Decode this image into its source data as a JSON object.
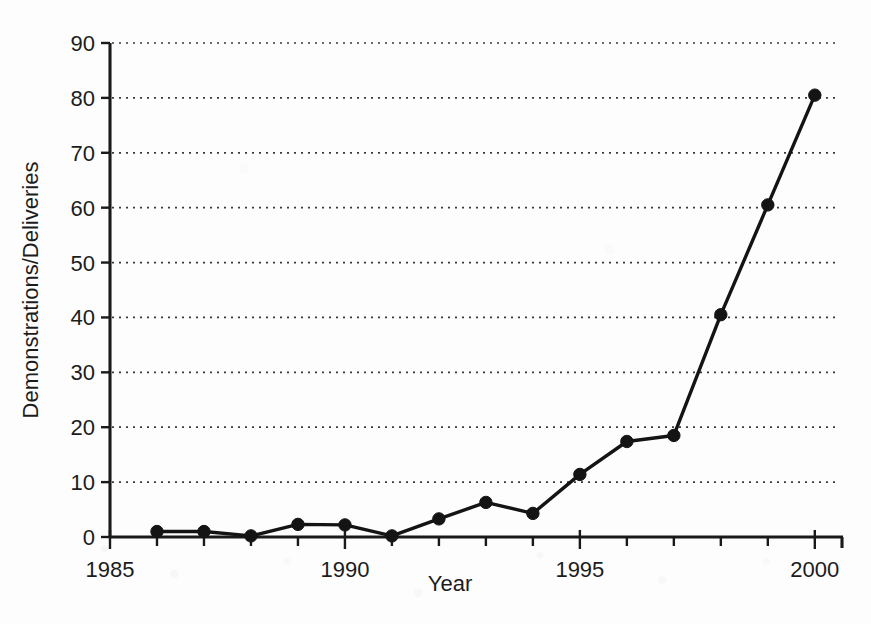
{
  "chart_data": {
    "type": "line",
    "title": "",
    "xlabel": "Year",
    "ylabel": "Demonstrations/Deliveries",
    "xlim": [
      1985,
      2000.6
    ],
    "ylim": [
      0,
      90
    ],
    "grid": true,
    "grid_axis": "y",
    "grid_style": "dotted",
    "legend": false,
    "legend_position": "none",
    "marker": "filled-circle",
    "line_color": "#141414",
    "x_major_ticks": [
      1985,
      1990,
      1995,
      2000
    ],
    "x_major_tick_labels": [
      "1985",
      "1990",
      "1995",
      "2000"
    ],
    "x_minor_ticks": [
      1986,
      1987,
      1988,
      1989,
      1991,
      1992,
      1993,
      1994,
      1996,
      1997,
      1998,
      1999
    ],
    "y_ticks": [
      0,
      10,
      20,
      30,
      40,
      50,
      60,
      70,
      80,
      90
    ],
    "y_tick_labels": [
      "0",
      "10",
      "20",
      "30",
      "40",
      "50",
      "60",
      "70",
      "80",
      "90"
    ],
    "x": [
      1986,
      1987,
      1988,
      1989,
      1990,
      1991,
      1992,
      1993,
      1994,
      1995,
      1996,
      1997,
      1998,
      1999,
      2000
    ],
    "values": [
      1.0,
      1.0,
      0.2,
      2.3,
      2.2,
      0.2,
      3.3,
      6.3,
      4.3,
      11.4,
      17.4,
      18.5,
      40.5,
      60.5,
      80.5
    ],
    "points": [
      {
        "year": 1986,
        "value": 1.0
      },
      {
        "year": 1987,
        "value": 1.0
      },
      {
        "year": 1988,
        "value": 0.2
      },
      {
        "year": 1989,
        "value": 2.3
      },
      {
        "year": 1990,
        "value": 2.2
      },
      {
        "year": 1991,
        "value": 0.2
      },
      {
        "year": 1992,
        "value": 3.3
      },
      {
        "year": 1993,
        "value": 6.3
      },
      {
        "year": 1994,
        "value": 4.3
      },
      {
        "year": 1995,
        "value": 11.4
      },
      {
        "year": 1996,
        "value": 17.4
      },
      {
        "year": 1997,
        "value": 18.5
      },
      {
        "year": 1998,
        "value": 40.5
      },
      {
        "year": 1999,
        "value": 60.5
      },
      {
        "year": 2000,
        "value": 80.5
      }
    ]
  }
}
